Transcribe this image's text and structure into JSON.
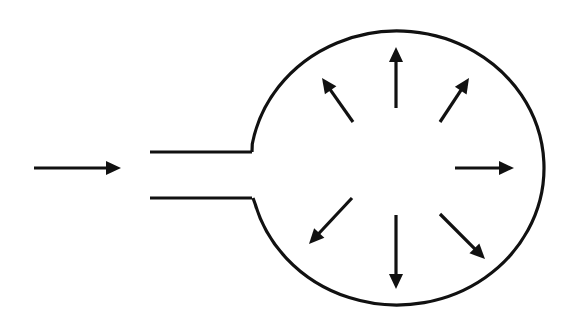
{
  "diagram": {
    "title": "",
    "colors": {
      "stroke": "#111111",
      "background": "#ffffff"
    },
    "inlet_arrow": {
      "x1": 34,
      "y1": 168,
      "x2": 121,
      "y2": 168
    },
    "tube": {
      "top_y": 152,
      "bottom_y": 198,
      "x_start": 150,
      "x_end": 252
    },
    "chamber": {
      "cx": 397,
      "cy": 168,
      "rx": 147,
      "ry": 137
    },
    "radial_arrows": [
      {
        "name": "up",
        "x1": 396,
        "y1": 108,
        "x2": 396,
        "y2": 47
      },
      {
        "name": "up-left",
        "x1": 353,
        "y1": 122,
        "x2": 322,
        "y2": 78
      },
      {
        "name": "up-right",
        "x1": 440,
        "y1": 122,
        "x2": 469,
        "y2": 78
      },
      {
        "name": "right",
        "x1": 455,
        "y1": 168,
        "x2": 514,
        "y2": 168
      },
      {
        "name": "down-left",
        "x1": 352,
        "y1": 198,
        "x2": 309,
        "y2": 244
      },
      {
        "name": "down",
        "x1": 396,
        "y1": 215,
        "x2": 396,
        "y2": 289
      },
      {
        "name": "down-right",
        "x1": 440,
        "y1": 214,
        "x2": 485,
        "y2": 259
      }
    ]
  }
}
